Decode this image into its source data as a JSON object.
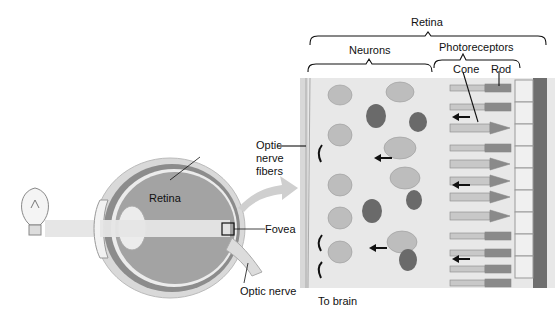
{
  "diagram": {
    "labels": {
      "retina_top": "Retina",
      "neurons": "Neurons",
      "photoreceptors": "Photoreceptors",
      "cone": "Cone",
      "rod": "Rod",
      "optic_nerve_fibers_1": "Optic",
      "optic_nerve_fibers_2": "nerve",
      "optic_nerve_fibers_3": "fibers",
      "retina_eye": "Retina",
      "fovea": "Fovea",
      "optic_nerve": "Optic nerve",
      "to_brain": "To brain"
    },
    "colors": {
      "panel_bg": "#e8e8e8",
      "eye_outer": "#cfcfcf",
      "eye_inner": "#9a9a9a",
      "light_beam": "#e6e6e6",
      "pigment": "#6e6e6e",
      "neuron": "#bdbdbd",
      "dark_neuron": "#5f5f5f"
    }
  }
}
